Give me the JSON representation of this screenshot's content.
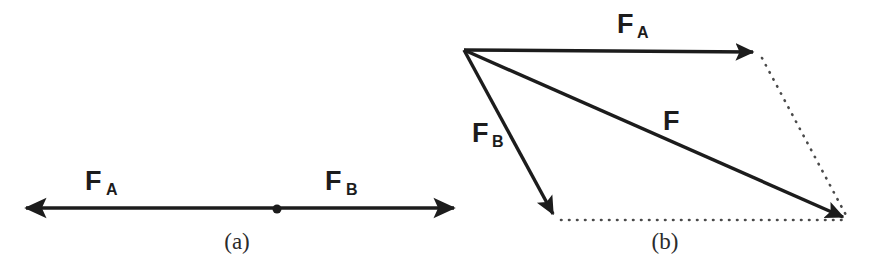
{
  "figure": {
    "stroke_color": "#1c1c1c",
    "dotted_color": "#4a4a4a",
    "background_color": "#ffffff",
    "panels": [
      {
        "id": "panel-a",
        "caption": "(a)",
        "caption_x": 237,
        "caption_y": 249,
        "description": "Two collinear forces of equal magnitude acting in opposite directions from a common point",
        "pivot": {
          "cx": 277,
          "cy": 209,
          "r": 4.5
        },
        "axis": {
          "x1": 22,
          "y1": 208,
          "x2": 458,
          "y2": 208
        },
        "vectors": [
          {
            "name": "F_A",
            "label": "F",
            "subscript": "A",
            "label_x": 85,
            "label_y": 190,
            "sub_x": 106,
            "sub_y": 195,
            "direction": "left",
            "tip_x": 22,
            "tip_y": 208,
            "tail_x": 277,
            "tail_y": 208
          },
          {
            "name": "F_B",
            "label": "F",
            "subscript": "B",
            "label_x": 325,
            "label_y": 190,
            "sub_x": 346,
            "sub_y": 195,
            "direction": "right",
            "tip_x": 458,
            "tip_y": 208,
            "tail_x": 277,
            "tail_y": 208
          }
        ]
      },
      {
        "id": "panel-b",
        "caption": "(b)",
        "caption_x": 665,
        "caption_y": 249,
        "description": "Parallelogram law of vector addition: F is the resultant of F_A and F_B",
        "origin": {
          "x": 464,
          "y": 50
        },
        "vectors": [
          {
            "name": "F_A",
            "label": "F",
            "subscript": "A",
            "label_x": 617,
            "label_y": 33,
            "sub_x": 637,
            "sub_y": 38,
            "x1": 464,
            "y1": 50,
            "x2": 760,
            "y2": 52
          },
          {
            "name": "F_B",
            "label": "F",
            "subscript": "B",
            "label_x": 472,
            "label_y": 142,
            "sub_x": 492,
            "sub_y": 147,
            "x1": 464,
            "y1": 50,
            "x2": 556,
            "y2": 220
          },
          {
            "name": "F_resultant",
            "label": "F",
            "subscript": "",
            "label_x": 663,
            "label_y": 130,
            "sub_x": 0,
            "sub_y": 0,
            "x1": 464,
            "y1": 50,
            "x2": 850,
            "y2": 220
          }
        ],
        "construction_lines": [
          {
            "name": "dotted-from-FA-tip",
            "x1": 762,
            "y1": 56,
            "x2": 848,
            "y2": 219
          },
          {
            "name": "dotted-from-FB-tip",
            "x1": 560,
            "y1": 220,
            "x2": 845,
            "y2": 220
          }
        ]
      }
    ]
  }
}
